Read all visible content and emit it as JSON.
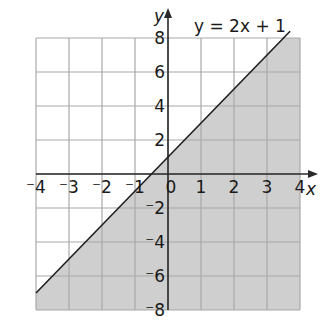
{
  "chart_data": {
    "type": "line",
    "title": "",
    "equation_label": "y = 2x + 1",
    "xlabel": "x",
    "ylabel": "y",
    "xlim": [
      -4,
      4
    ],
    "ylim": [
      -8,
      8
    ],
    "grid": true,
    "x_ticks": [
      -4,
      -3,
      -2,
      -1,
      0,
      1,
      2,
      3,
      4
    ],
    "x_tick_labels": [
      "⁻4",
      "⁻3",
      "⁻2",
      "⁻1",
      "0",
      "1",
      "2",
      "3",
      "4"
    ],
    "y_ticks": [
      -8,
      -6,
      -4,
      -2,
      2,
      4,
      6,
      8
    ],
    "y_tick_labels": [
      "⁻8",
      "⁻6",
      "⁻4",
      "⁻2",
      "2",
      "4",
      "6",
      "8"
    ],
    "series": [
      {
        "name": "y = 2x + 1",
        "slope": 2,
        "intercept": 1,
        "x": [
          -4,
          3.5
        ],
        "y": [
          -7,
          8
        ]
      }
    ],
    "shaded_region": {
      "description": "region below/right of line y = 2x + 1 (y < 2x + 1)",
      "color": "#cfcfcf"
    }
  },
  "colors": {
    "background": "#ffffff",
    "grid": "#a8a8a8",
    "axis": "#2a2a2a",
    "line": "#1f1f1f",
    "shade": "#cfcfcf"
  }
}
